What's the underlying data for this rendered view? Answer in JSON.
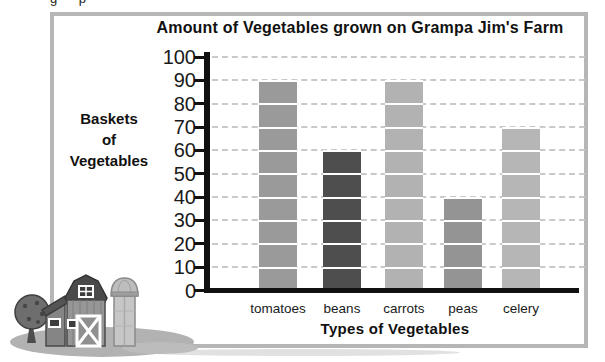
{
  "page": {
    "background": "#ffffff",
    "cropped_text_fragment": "g p",
    "frame_border_color": "#b6b6b6"
  },
  "chart_data": {
    "type": "bar",
    "title": "Amount of Vegetables grown on Grampa Jim's Farm",
    "xlabel": "Types of Vegetables",
    "ylabel": "Baskets of Vegetables",
    "ylabel_lines": [
      "Baskets",
      "of",
      "Vegetables"
    ],
    "categories": [
      "tomatoes",
      "beans",
      "carrots",
      "peas",
      "celery"
    ],
    "values": [
      90,
      60,
      90,
      40,
      70
    ],
    "bar_colors": [
      "#9a9a9a",
      "#4e4e4e",
      "#b2b2b2",
      "#949494",
      "#b6b6b6"
    ],
    "ylim": [
      0,
      100
    ],
    "yticks": [
      100,
      90,
      80,
      70,
      60,
      50,
      40,
      30,
      20,
      10,
      0
    ],
    "grid": "horizontal dashed gray, rendered white where crossing bars",
    "legend": "none",
    "axis_color": "#111111",
    "grid_color": "#c9c9c9"
  },
  "illustration": {
    "name": "barn-with-silo-and-tree",
    "style": "grayscale clipart at bottom-left overlapping the frame"
  }
}
